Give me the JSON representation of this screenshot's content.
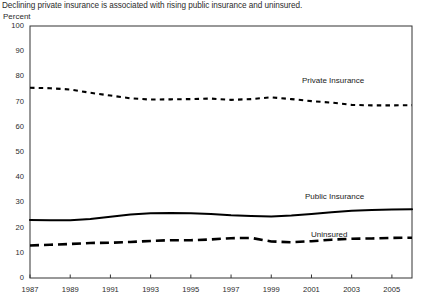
{
  "chart_data": {
    "type": "line",
    "title": "Declining private insurance is associated with rising public insurance and uninsured.",
    "ylabel": "Percent",
    "xlabel": "",
    "ylim": [
      0,
      100
    ],
    "xlim": [
      1987,
      2006
    ],
    "grid": false,
    "legend_position": "inline-annotations",
    "y_ticks": [
      0,
      10,
      20,
      30,
      40,
      50,
      60,
      70,
      80,
      90,
      100
    ],
    "x_ticks": [
      1987,
      1989,
      1991,
      1993,
      1995,
      1997,
      1999,
      2001,
      2003,
      2005
    ],
    "x": [
      1987,
      1988,
      1989,
      1990,
      1991,
      1992,
      1993,
      1994,
      1995,
      1996,
      1997,
      1998,
      1999,
      2000,
      2001,
      2002,
      2003,
      2004,
      2005,
      2006
    ],
    "series": [
      {
        "name": "Private Insurance",
        "style": "dotted",
        "color": "#000000",
        "values": [
          75.5,
          75.3,
          74.8,
          73.5,
          72.4,
          71.3,
          70.8,
          70.9,
          71.0,
          71.2,
          70.7,
          71.0,
          71.7,
          71.0,
          70.2,
          69.6,
          68.7,
          68.5,
          68.5,
          68.6
        ]
      },
      {
        "name": "Public Insurance",
        "style": "solid",
        "color": "#000000",
        "values": [
          23.0,
          22.9,
          22.9,
          23.4,
          24.3,
          25.2,
          25.7,
          25.8,
          25.7,
          25.4,
          24.9,
          24.6,
          24.4,
          24.8,
          25.4,
          26.1,
          26.7,
          27.0,
          27.2,
          27.3
        ]
      },
      {
        "name": "Uninsured",
        "style": "dashed",
        "color": "#000000",
        "values": [
          12.9,
          13.2,
          13.5,
          13.9,
          14.0,
          14.3,
          14.7,
          15.0,
          15.0,
          15.3,
          15.8,
          15.9,
          14.5,
          14.2,
          14.6,
          15.2,
          15.6,
          15.7,
          15.9,
          16.0
        ]
      }
    ],
    "annotations": [
      {
        "text": "Private Insurance",
        "x": 2001,
        "y": 80
      },
      {
        "text": "Public Insurance",
        "x": 2003,
        "y": 33
      },
      {
        "text": "Uninsured",
        "x": 2001.5,
        "y": 21
      }
    ]
  }
}
